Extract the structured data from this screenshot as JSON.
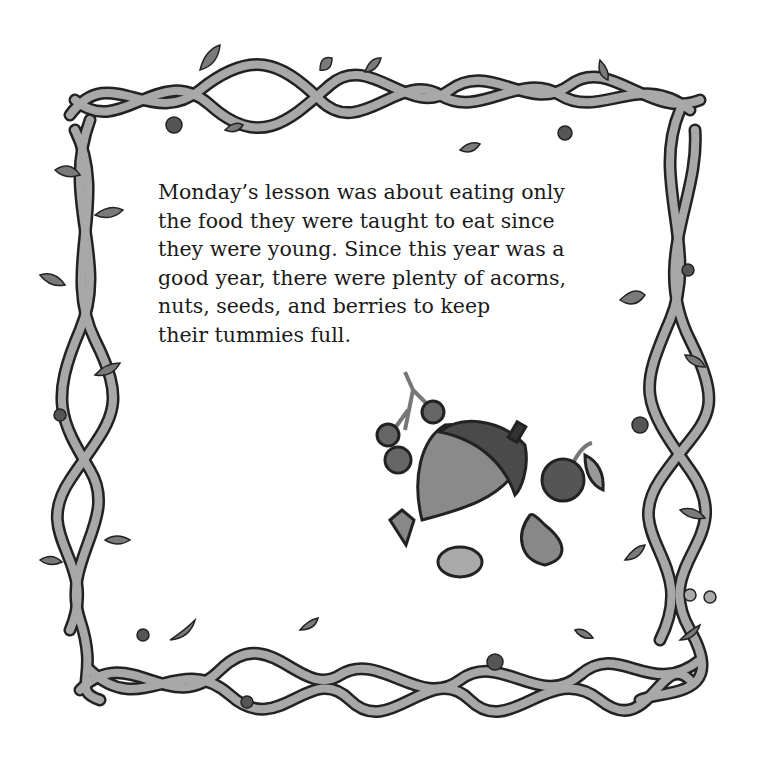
{
  "page": {
    "story_lines": [
      "Monday’s lesson was about eating only",
      "the food they were taught to eat since",
      "they were young. Since this year was a",
      "good year, there were plenty of acorns,",
      "nuts, seeds, and berries to keep",
      "their tummies full."
    ],
    "illustration": {
      "items": [
        "berry-cluster",
        "acorn",
        "cherry",
        "seed",
        "almond",
        "nut"
      ]
    },
    "border": "vine-frame"
  },
  "colors": {
    "vine_fill": "#a8a8a8",
    "vine_outline": "#222222",
    "leaf_fill": "#7a7a7a",
    "berry_fill": "#555555",
    "acorn_body": "#8a8a8a",
    "acorn_cap": "#4a4a4a",
    "text": "#1a1a1a"
  }
}
